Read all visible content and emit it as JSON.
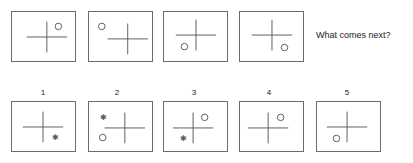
{
  "prompt": {
    "question": "What comes next?"
  },
  "style": {
    "stroke_color": "#5a5a5a",
    "border_color": "#6b6b6b",
    "text_color": "#1a1a1a",
    "background_color": "#ffffff"
  },
  "sequence": {
    "name": "question-sequence",
    "panels": [
      {
        "index": 1,
        "cross_x": 47,
        "cross_y": 37,
        "symbols": [
          {
            "glyph": "circle",
            "position": "upper-right",
            "x": 59,
            "y": 26
          }
        ]
      },
      {
        "index": 2,
        "cross_x": 128,
        "cross_y": 39,
        "symbols": [
          {
            "glyph": "circle",
            "position": "upper-left",
            "x": 101,
            "y": 26
          }
        ]
      },
      {
        "index": 3,
        "cross_x": 196,
        "cross_y": 35,
        "symbols": [
          {
            "glyph": "circle",
            "position": "lower-left",
            "x": 184,
            "y": 47
          }
        ]
      },
      {
        "index": 4,
        "cross_x": 272,
        "cross_y": 35,
        "symbols": [
          {
            "glyph": "circle",
            "position": "lower-right",
            "x": 285,
            "y": 48
          }
        ]
      }
    ]
  },
  "options": {
    "name": "answer-options",
    "items": [
      {
        "label": "1",
        "cross_x": 43,
        "cross_y": 127,
        "symbols": [
          {
            "glyph": "asterisk",
            "position": "lower-right",
            "x": 56,
            "y": 137
          }
        ]
      },
      {
        "label": "2",
        "cross_x": 125,
        "cross_y": 128,
        "symbols": [
          {
            "glyph": "asterisk",
            "position": "upper-left",
            "x": 103,
            "y": 117
          },
          {
            "glyph": "circle",
            "position": "lower-left",
            "x": 102,
            "y": 138
          }
        ]
      },
      {
        "label": "3",
        "cross_x": 193,
        "cross_y": 128,
        "symbols": [
          {
            "glyph": "circle",
            "position": "upper-right",
            "x": 205,
            "y": 117
          },
          {
            "glyph": "asterisk",
            "position": "lower-left",
            "x": 183,
            "y": 138
          }
        ]
      },
      {
        "label": "4",
        "cross_x": 268,
        "cross_y": 128,
        "symbols": [
          {
            "glyph": "circle",
            "position": "upper-right",
            "x": 281,
            "y": 117
          }
        ]
      },
      {
        "label": "5",
        "cross_x": 347,
        "cross_y": 127,
        "symbols": [
          {
            "glyph": "circle",
            "position": "lower-left",
            "x": 336,
            "y": 139
          }
        ]
      }
    ]
  },
  "geometry": {
    "question_boxes": [
      {
        "left": 11,
        "top": 11,
        "width": 65,
        "height": 51
      },
      {
        "left": 88,
        "top": 11,
        "width": 65,
        "height": 51
      },
      {
        "left": 163,
        "top": 11,
        "width": 65,
        "height": 51
      },
      {
        "left": 239,
        "top": 11,
        "width": 65,
        "height": 51
      }
    ],
    "option_boxes": [
      {
        "left": 11,
        "top": 101,
        "width": 65,
        "height": 51
      },
      {
        "left": 88,
        "top": 101,
        "width": 65,
        "height": 51
      },
      {
        "left": 163,
        "top": 101,
        "width": 65,
        "height": 51
      },
      {
        "left": 239,
        "top": 101,
        "width": 65,
        "height": 51
      },
      {
        "left": 316,
        "top": 101,
        "width": 65,
        "height": 51
      }
    ],
    "option_label_positions": [
      {
        "left": 33,
        "top": 88
      },
      {
        "left": 107,
        "top": 88
      },
      {
        "left": 184,
        "top": 88
      },
      {
        "left": 259,
        "top": 88
      },
      {
        "left": 337,
        "top": 88
      }
    ],
    "cross_arm_h": 21,
    "cross_arm_v": 16,
    "circle_radius": 3.4,
    "asterisk_size": 8
  }
}
